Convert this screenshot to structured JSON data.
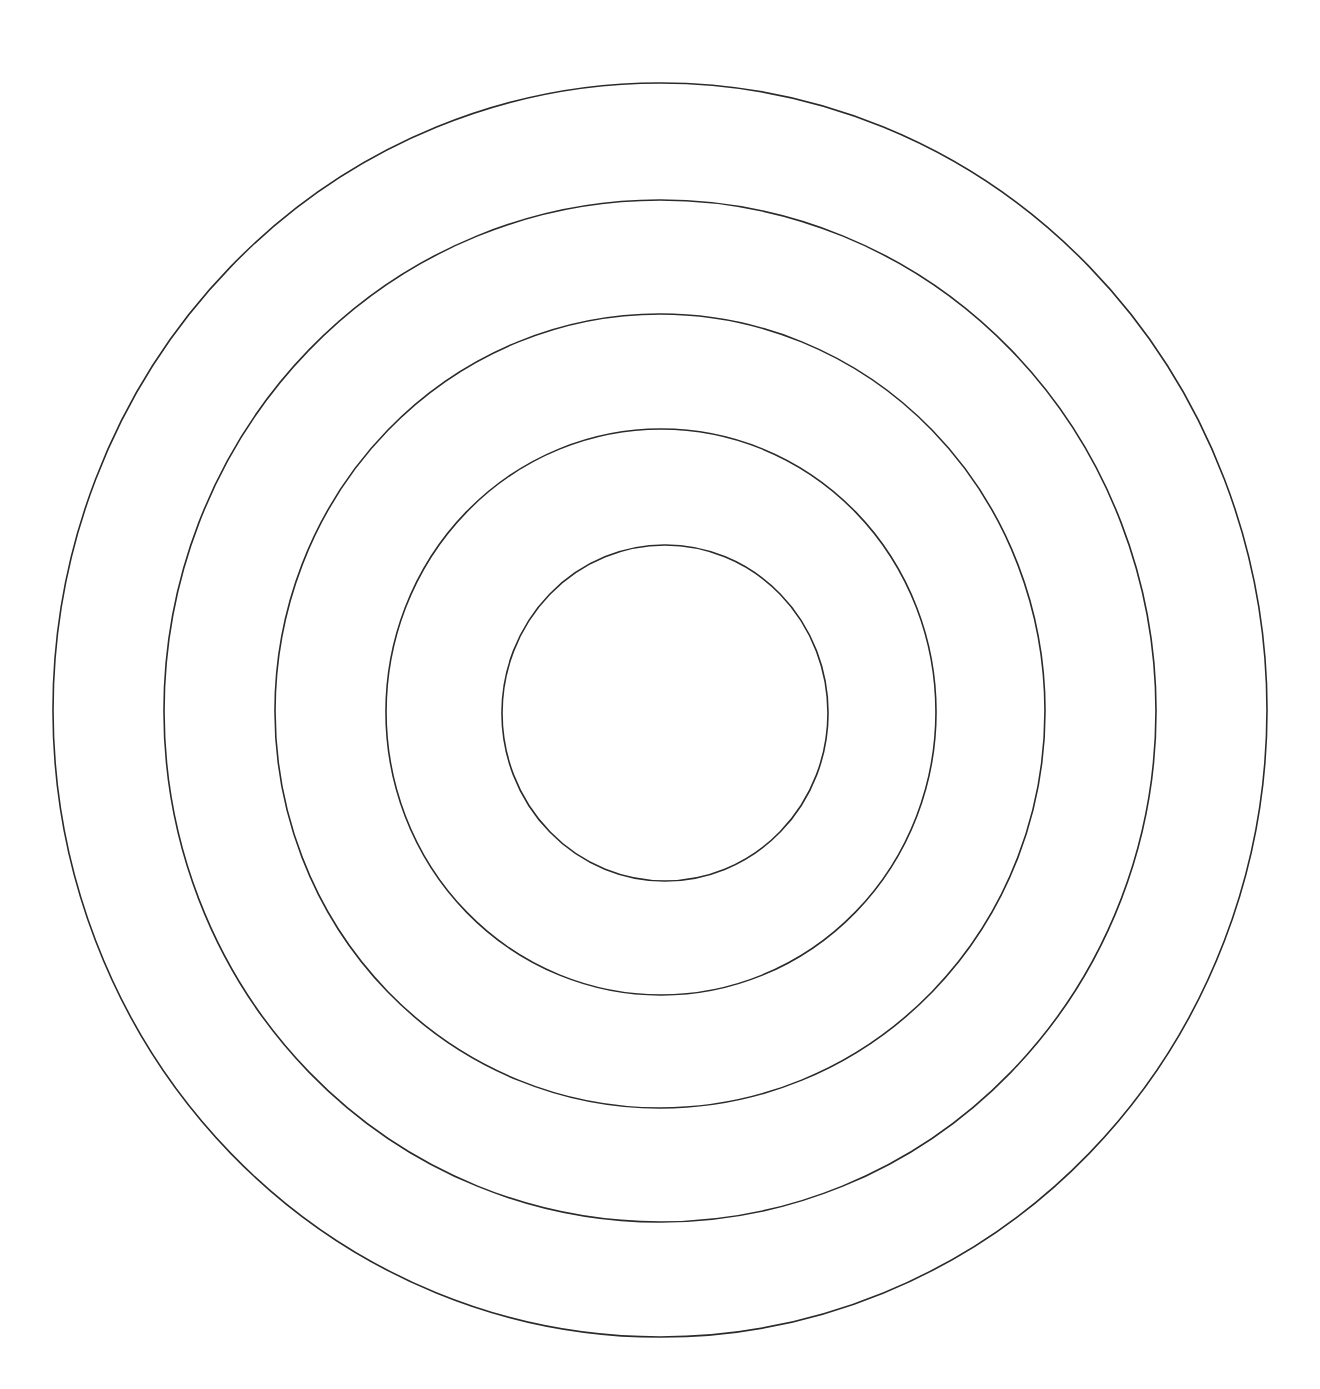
{
  "diagram": {
    "type": "concentric-circles",
    "background": "#ffffff",
    "stroke_color": "#2a2a2a",
    "stroke_width": 1.6,
    "rings": [
      {
        "name": "ring-1-outer",
        "cx": 660,
        "cy": 710,
        "rx": 607,
        "ry": 627
      },
      {
        "name": "ring-2",
        "cx": 660,
        "cy": 711,
        "rx": 496,
        "ry": 511
      },
      {
        "name": "ring-3",
        "cx": 660,
        "cy": 711,
        "rx": 385,
        "ry": 397
      },
      {
        "name": "ring-4",
        "cx": 661,
        "cy": 712,
        "rx": 275,
        "ry": 283
      },
      {
        "name": "ring-5-inner",
        "cx": 665,
        "cy": 713,
        "rx": 163,
        "ry": 168
      }
    ]
  }
}
